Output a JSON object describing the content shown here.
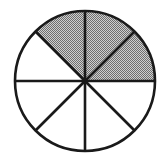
{
  "figure": {
    "name": "fraction-circle-diagram",
    "background_color": "#ffffff",
    "canvas": {
      "width": 168,
      "height": 167
    }
  },
  "circle": {
    "center_x": 85,
    "center_y": 81,
    "radius": 70,
    "outline_color": "#1a1a1a",
    "outline_width": 2.6,
    "fill_color": "#ffffff"
  },
  "spokes": {
    "count": 4,
    "line_color": "#1a1a1a",
    "line_width": 2.6,
    "angles_deg": [
      0,
      45,
      90,
      135
    ]
  },
  "shading": {
    "fill_color": "#a8a8a8",
    "pattern": "dither-halftone",
    "pattern_dot_color": "#6e6e6e",
    "pattern_base_color": "#cfcfcf"
  },
  "chart_data": {
    "type": "pie",
    "title": "",
    "subtitle": "",
    "xlabel": "",
    "ylabel": "",
    "total_sectors": 8,
    "shaded_sectors": 3,
    "unshaded_sectors": 5,
    "fraction_shaded": "3/8",
    "sector_angle_deg": 45,
    "legend": [],
    "grid": false,
    "categories": [
      "sector-1",
      "sector-2",
      "sector-3",
      "sector-4",
      "sector-5",
      "sector-6",
      "sector-7",
      "sector-8"
    ],
    "values": [
      1,
      1,
      1,
      1,
      1,
      1,
      1,
      1
    ],
    "series": [
      {
        "name": "sectors",
        "values": [
          1,
          1,
          1,
          1,
          1,
          1,
          1,
          1
        ]
      }
    ],
    "sectors": [
      {
        "index": 1,
        "start_deg": 0,
        "end_deg": 45,
        "shaded": true,
        "label": ""
      },
      {
        "index": 2,
        "start_deg": 45,
        "end_deg": 90,
        "shaded": true,
        "label": ""
      },
      {
        "index": 3,
        "start_deg": 90,
        "end_deg": 135,
        "shaded": true,
        "label": ""
      },
      {
        "index": 4,
        "start_deg": 135,
        "end_deg": 180,
        "shaded": false,
        "label": ""
      },
      {
        "index": 5,
        "start_deg": 180,
        "end_deg": 225,
        "shaded": false,
        "label": ""
      },
      {
        "index": 6,
        "start_deg": 225,
        "end_deg": 270,
        "shaded": false,
        "label": ""
      },
      {
        "index": 7,
        "start_deg": 270,
        "end_deg": 315,
        "shaded": false,
        "label": ""
      },
      {
        "index": 8,
        "start_deg": 315,
        "end_deg": 360,
        "shaded": false,
        "label": ""
      }
    ]
  }
}
